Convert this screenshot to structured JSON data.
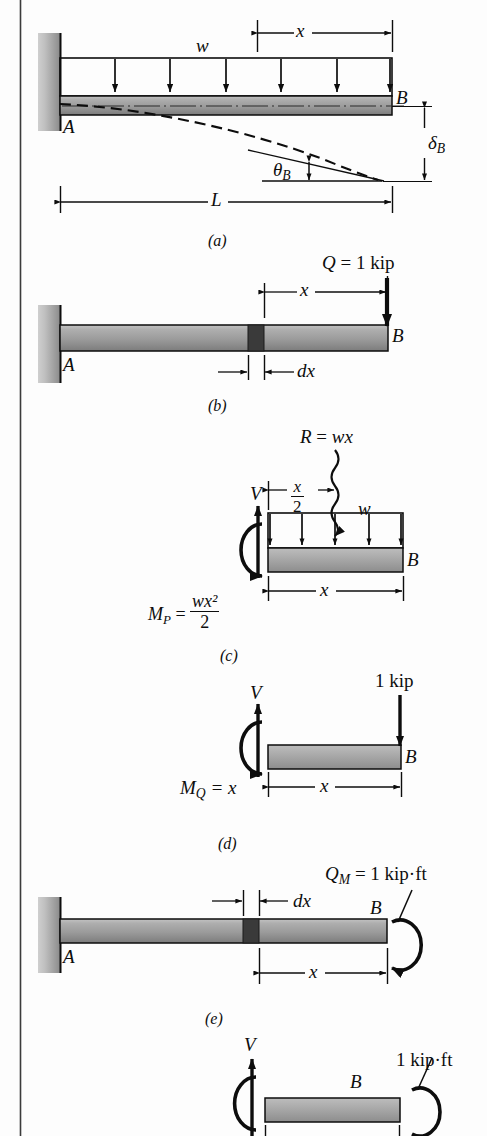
{
  "figure": {
    "colors": {
      "ink": "#0d0d0d",
      "beam_light": "#b4b4b4",
      "beam_dark": "#7d7d7d",
      "beam_mid": "#9a9a9a",
      "wall_light": "#d2d2d2",
      "wall_dark": "#8e8e8e",
      "dx_block": "#3a3a3a",
      "page": "#fdfdfd",
      "border": "#3b3b3b"
    },
    "panels": [
      {
        "id": "a",
        "caption": "(a)",
        "labels": {
          "support_A": "A",
          "tip_B": "B",
          "distributed_load": "w",
          "dim_x": "x",
          "dim_L": "L",
          "deflection": "δ",
          "deflection_sub": "B",
          "rotation": "θ",
          "rotation_sub": "B"
        }
      },
      {
        "id": "b",
        "caption": "(b)",
        "labels": {
          "support_A": "A",
          "tip_B": "B",
          "unit_load": "Q = 1 kip",
          "dim_x": "x",
          "dim_dx": "dx"
        }
      },
      {
        "id": "c",
        "caption": "(c)",
        "labels": {
          "resultant": "R = wx",
          "distributed_load": "w",
          "tip_B": "B",
          "shear": "V",
          "dim_half_x_num": "x",
          "dim_half_x_den": "2",
          "dim_x": "x",
          "moment_lhs": "M",
          "moment_sub": "P",
          "moment_eq": "=",
          "moment_num": "wx²",
          "moment_den": "2"
        }
      },
      {
        "id": "d",
        "caption": "(d)",
        "labels": {
          "unit_load": "1 kip",
          "tip_B": "B",
          "shear": "V",
          "dim_x": "x",
          "moment_lhs": "M",
          "moment_sub": "Q",
          "moment_rhs": "= x"
        }
      },
      {
        "id": "e",
        "caption": "(e)",
        "labels": {
          "support_A": "A",
          "tip_B": "B",
          "unit_moment": "Q",
          "unit_moment_sub": "M",
          "unit_moment_rhs": "= 1 kip·ft",
          "dim_dx": "dx",
          "dim_x": "x"
        }
      },
      {
        "id": "f",
        "caption": "",
        "labels": {
          "unit_moment": "1 kip·ft",
          "tip_B": "B",
          "shear": "V"
        }
      }
    ]
  }
}
